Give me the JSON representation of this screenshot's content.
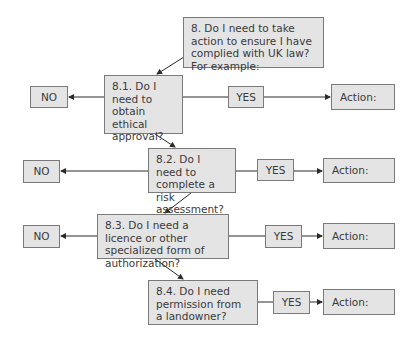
{
  "diagram": {
    "root": {
      "text": "8. Do I need to take action to ensure I have complied with UK law? For example:"
    },
    "questions": [
      {
        "id": "8.1",
        "text": "8.1. Do I need to obtain ethical approval?",
        "no": "NO",
        "yes": "YES",
        "action": "Action:"
      },
      {
        "id": "8.2",
        "text": "8.2. Do I need to complete a risk assessment?",
        "no": "NO",
        "yes": "YES",
        "action": "Action:"
      },
      {
        "id": "8.3",
        "text": "8.3. Do I need a licence or other specialized form of authorization?",
        "no": "NO",
        "yes": "YES",
        "action": "Action:"
      },
      {
        "id": "8.4",
        "text": "8.4. Do I need permission from a landowner?",
        "yes": "YES",
        "action": "Action:"
      }
    ],
    "colors": {
      "box_fill": "#e4e4e4",
      "box_border": "#7a7a7a",
      "line": "#2a2a2a",
      "text": "#3a3a3a"
    }
  }
}
